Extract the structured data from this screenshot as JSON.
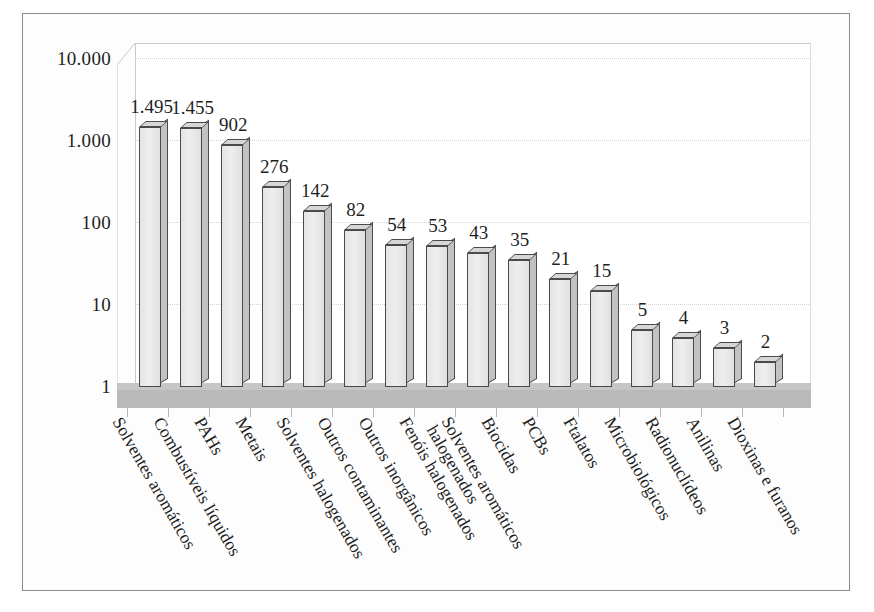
{
  "chart_data": {
    "type": "bar",
    "title": "",
    "subtitle": "",
    "xlabel": "",
    "ylabel": "",
    "scale": "log",
    "ylim": [
      1,
      10000
    ],
    "grid": true,
    "legend": "none",
    "y_ticks": [
      "10.000",
      "1.000",
      "100",
      "10",
      "1"
    ],
    "y_tick_values": [
      10000,
      1000,
      100,
      10,
      1
    ],
    "categories": [
      "Solventes aromáticos",
      "Combustíveis líquidos",
      "PAHs",
      "Metais",
      "Solventes halogenados",
      "Outros contaminantes",
      "Outros inorgânicos",
      "Fenóis halogenados",
      "Solventes aromáticos halogenados",
      "Biocidas",
      "PCBs",
      "Ftalatos",
      "Microbiológicos",
      "Radionuclídeos",
      "Anilinas",
      "Dioxinas e furanos"
    ],
    "values": [
      1495,
      1455,
      902,
      276,
      142,
      82,
      54,
      53,
      43,
      35,
      21,
      15,
      5,
      4,
      3,
      2
    ],
    "value_labels": [
      "1.495",
      "1.455",
      "902",
      "276",
      "142",
      "82",
      "54",
      "53",
      "43",
      "35",
      "21",
      "15",
      "5",
      "4",
      "3",
      "2"
    ]
  },
  "style": {
    "bar_face_color": "#e9e9e9",
    "bar_edge_color": "#4a4a4a",
    "bar_side_color": "#c2c2c2",
    "bar_top_color": "#d6d6d6",
    "floor_color": "#b9b9b9",
    "gridline_color": "#d2d2d2",
    "frame_color": "#8b8b8b",
    "background_color": "#ffffff",
    "text_color": "#1f1f1f"
  }
}
